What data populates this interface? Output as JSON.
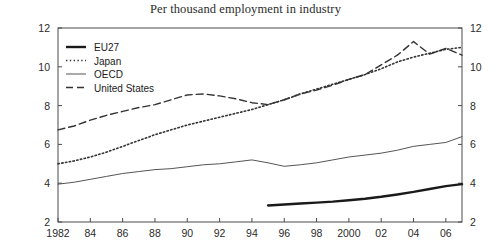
{
  "chart_data": {
    "type": "line",
    "title": "Per thousand employment in industry",
    "xlabel": "",
    "ylabel": "",
    "xlim": [
      1982,
      2007
    ],
    "ylim": [
      2,
      12
    ],
    "ytick_values": [
      2,
      4,
      6,
      8,
      10,
      12
    ],
    "ytick_labels": [
      "2",
      "4",
      "6",
      "8",
      "10",
      "12"
    ],
    "xtick_values": [
      1982,
      1984,
      1986,
      1988,
      1990,
      1992,
      1994,
      1996,
      1998,
      2000,
      2002,
      2004,
      2006
    ],
    "xtick_labels": [
      "1982",
      "84",
      "86",
      "88",
      "90",
      "92",
      "94",
      "96",
      "98",
      "2000",
      "02",
      "04",
      "06"
    ],
    "grid": false,
    "legend_position": "upper-left",
    "right_axis_mirrored": true,
    "series": [
      {
        "name": "EU27",
        "style": "solid-thick",
        "color": "#1a1a1a",
        "x": [
          1995,
          1996,
          1997,
          1998,
          1999,
          2000,
          2001,
          2002,
          2003,
          2004,
          2005,
          2006,
          2007
        ],
        "values": [
          2.85,
          2.9,
          2.95,
          3.0,
          3.05,
          3.12,
          3.2,
          3.3,
          3.42,
          3.55,
          3.7,
          3.85,
          3.95
        ]
      },
      {
        "name": "Japan",
        "style": "dotted",
        "color": "#333333",
        "x": [
          1982,
          1983,
          1984,
          1985,
          1986,
          1987,
          1988,
          1989,
          1990,
          1991,
          1992,
          1993,
          1994,
          1995,
          1996,
          1997,
          1998,
          1999,
          2000,
          2001,
          2002,
          2003,
          2004,
          2005,
          2006,
          2007
        ],
        "values": [
          5.0,
          5.15,
          5.35,
          5.6,
          5.9,
          6.2,
          6.5,
          6.75,
          7.0,
          7.2,
          7.4,
          7.6,
          7.8,
          8.05,
          8.3,
          8.6,
          8.85,
          9.1,
          9.35,
          9.6,
          9.9,
          10.25,
          10.5,
          10.7,
          10.9,
          11.0
        ]
      },
      {
        "name": "OECD",
        "style": "solid-thin",
        "color": "#555555",
        "x": [
          1982,
          1983,
          1984,
          1985,
          1986,
          1987,
          1988,
          1989,
          1990,
          1991,
          1992,
          1993,
          1994,
          1995,
          1996,
          1997,
          1998,
          1999,
          2000,
          2001,
          2002,
          2003,
          2004,
          2005,
          2006,
          2007
        ],
        "values": [
          3.95,
          4.05,
          4.2,
          4.35,
          4.5,
          4.6,
          4.7,
          4.75,
          4.85,
          4.95,
          5.0,
          5.1,
          5.2,
          5.05,
          4.87,
          4.95,
          5.05,
          5.2,
          5.35,
          5.45,
          5.55,
          5.7,
          5.9,
          6.0,
          6.1,
          6.4
        ]
      },
      {
        "name": "United States",
        "style": "dashed",
        "color": "#333333",
        "x": [
          1982,
          1983,
          1984,
          1985,
          1986,
          1987,
          1988,
          1989,
          1990,
          1991,
          1992,
          1993,
          1994,
          1995,
          1996,
          1997,
          1998,
          1999,
          2000,
          2001,
          2002,
          2003,
          2004,
          2005,
          2006,
          2007
        ],
        "values": [
          6.75,
          6.95,
          7.25,
          7.5,
          7.7,
          7.9,
          8.05,
          8.3,
          8.55,
          8.6,
          8.5,
          8.35,
          8.15,
          8.05,
          8.3,
          8.6,
          8.8,
          9.05,
          9.35,
          9.6,
          10.1,
          10.6,
          11.3,
          10.65,
          10.95,
          10.6
        ]
      }
    ]
  }
}
